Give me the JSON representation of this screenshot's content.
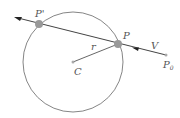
{
  "diagram": {
    "labels": {
      "p_prime": "P'",
      "p": "P",
      "v": "V",
      "p0": "P",
      "p0_sub": "0",
      "r": "r",
      "c": "C"
    },
    "colors": {
      "line": "#555555",
      "point_large": "#999999",
      "point_small": "#aaaaaa",
      "text": "#555555"
    },
    "circle": {
      "cx": 73,
      "cy": 62,
      "r": 50
    },
    "points": {
      "p_prime": [
        39,
        24
      ],
      "p": [
        118,
        44
      ],
      "c": [
        73,
        62
      ],
      "p0": [
        166,
        55
      ]
    }
  }
}
